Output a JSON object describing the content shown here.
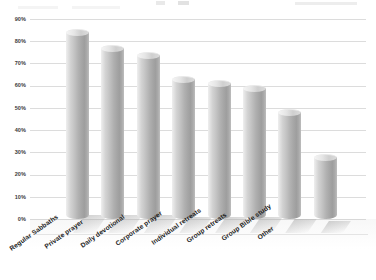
{
  "chart_data": {
    "type": "bar",
    "title": "",
    "subtitle": "",
    "xlabel": "",
    "ylabel": "",
    "ylim": [
      0,
      90
    ],
    "ytick_step": 10,
    "grid": true,
    "legend": "none",
    "style": "3d-cylinder-grayscale",
    "categories": [
      "Regular Sabbaths",
      "Private prayer",
      "Daily devotional",
      "Corporate prayer",
      "Individual retreats",
      "Group retreats",
      "Group Bible study",
      "Other"
    ],
    "values": [
      84,
      77,
      74,
      63,
      61,
      59,
      48,
      28
    ],
    "yticks": [
      "0%",
      "10%",
      "20%",
      "30%",
      "40%",
      "50%",
      "60%",
      "70%",
      "80%",
      "90%"
    ],
    "ytick_values": [
      0,
      10,
      20,
      30,
      40,
      50,
      60,
      70,
      80,
      90
    ],
    "value_format": "percent",
    "series": [
      {
        "name": "",
        "values": [
          84,
          77,
          74,
          63,
          61,
          59,
          48,
          28
        ]
      }
    ]
  },
  "colors": {
    "bar_light": "#efefef",
    "bar_mid": "#bdbdbd",
    "bar_dark": "#9e9e9e",
    "gridline": "#dcdcdc",
    "axis_text": "#3a3a3a",
    "label_text": "#1c1c1c",
    "background": "#ffffff"
  }
}
